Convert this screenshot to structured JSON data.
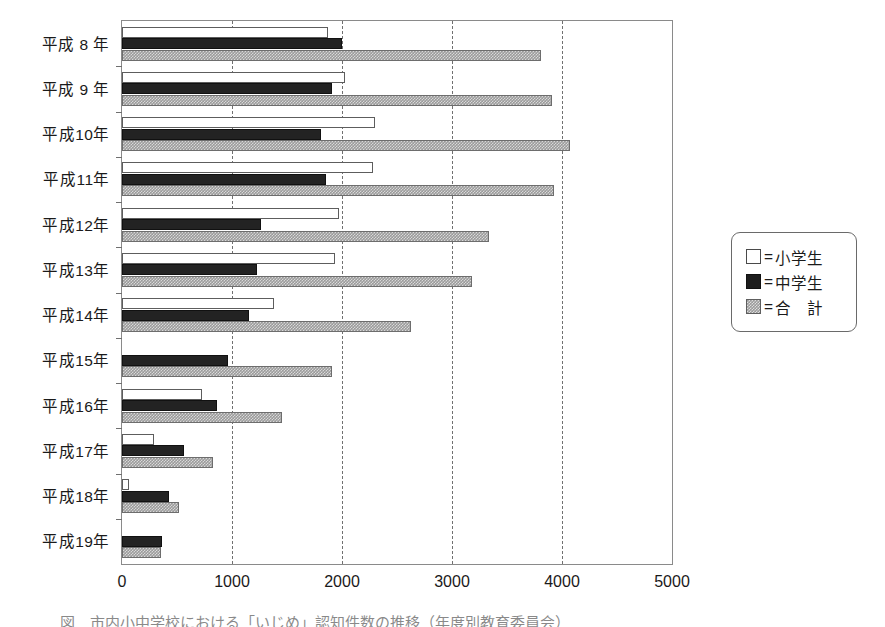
{
  "chart_data": {
    "type": "bar",
    "orientation": "horizontal",
    "title": "",
    "xlabel": "",
    "ylabel": "",
    "xlim": [
      0,
      5000
    ],
    "xticks": [
      0,
      1000,
      2000,
      3000,
      4000,
      5000
    ],
    "xtick_labels": [
      "0",
      "1000",
      "2000",
      "3000",
      "4000",
      "5000"
    ],
    "grid": true,
    "grid_style": "dashed-vertical",
    "legend_position": "right-outside",
    "categories": [
      "平成 8 年",
      "平成 9 年",
      "平成10年",
      "平成11年",
      "平成12年",
      "平成13年",
      "平成14年",
      "平成15年",
      "平成16年",
      "平成17年",
      "平成18年",
      "平成19年"
    ],
    "series": [
      {
        "name": "小学生",
        "color": "#ffffff",
        "pattern": "open",
        "values": [
          1870,
          2030,
          2300,
          2280,
          1970,
          1940,
          1380,
          0,
          730,
          290,
          60,
          0
        ]
      },
      {
        "name": "中学生",
        "color": "#232323",
        "pattern": "solid",
        "values": [
          2000,
          1910,
          1810,
          1850,
          1260,
          1230,
          1150,
          960,
          860,
          560,
          430,
          360
        ]
      },
      {
        "name": "合　計",
        "color": "#9b9b9b",
        "pattern": "hatched",
        "values": [
          3810,
          3910,
          4070,
          3930,
          3340,
          3180,
          2630,
          1910,
          1450,
          830,
          520,
          350
        ]
      }
    ]
  },
  "legend": {
    "equals": "=",
    "items": [
      {
        "swatch": "white-square-icon",
        "label": "小学生"
      },
      {
        "swatch": "black-square-icon",
        "label": "中学生"
      },
      {
        "swatch": "hatched-square-icon",
        "label": "合　計"
      }
    ]
  },
  "caption": {
    "text": "図　市内小中学校における「いじめ」認知件数の推移（年度別教育委員会）"
  }
}
